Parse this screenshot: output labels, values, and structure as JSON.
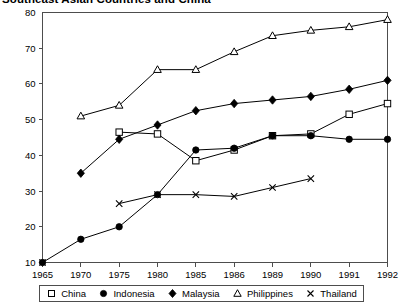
{
  "title": "Southeast Asian Countries and China",
  "legend": {
    "items": [
      {
        "label": "China",
        "marker": "open-square"
      },
      {
        "label": "Indonesia",
        "marker": "filled-circle"
      },
      {
        "label": "Malaysia",
        "marker": "filled-diamond"
      },
      {
        "label": "Philippines",
        "marker": "open-triangle"
      },
      {
        "label": "Thailand",
        "marker": "cross"
      }
    ]
  },
  "chart_data": {
    "type": "line",
    "title": "Southeast Asian Countries and China",
    "xlabel": "",
    "ylabel": "",
    "categories": [
      "1965",
      "1970",
      "1975",
      "1980",
      "1985",
      "1986",
      "1989",
      "1990",
      "1991",
      "1992"
    ],
    "ylim": [
      10,
      80
    ],
    "yticks": [
      10,
      20,
      30,
      40,
      50,
      60,
      70,
      80
    ],
    "grid": false,
    "legend_position": "bottom",
    "series": [
      {
        "name": "China",
        "marker": "open-square",
        "values": [
          null,
          null,
          46.5,
          46,
          38.5,
          41.5,
          45.5,
          46,
          51.5,
          54.5
        ]
      },
      {
        "name": "Indonesia",
        "marker": "filled-circle",
        "values": [
          10,
          16.5,
          20,
          29,
          41.5,
          42,
          45.5,
          45.5,
          44.5,
          44.5
        ]
      },
      {
        "name": "Malaysia",
        "marker": "filled-diamond",
        "values": [
          null,
          35,
          44.5,
          48.5,
          52.5,
          54.5,
          55.5,
          56.5,
          58.5,
          61
        ]
      },
      {
        "name": "Philippines",
        "marker": "open-triangle",
        "values": [
          null,
          51,
          54,
          64,
          64,
          69,
          73.5,
          75,
          76,
          78
        ]
      },
      {
        "name": "Thailand",
        "marker": "cross",
        "values": [
          10,
          null,
          26.5,
          29,
          29,
          28.5,
          31,
          33.5,
          null,
          null
        ]
      }
    ]
  }
}
